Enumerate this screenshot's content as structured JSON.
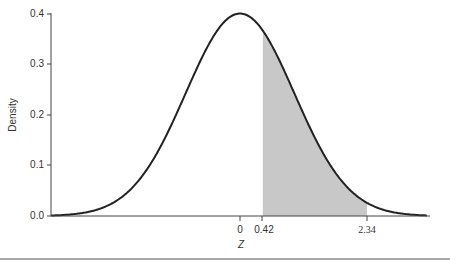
{
  "chart_data": {
    "type": "area",
    "title": "",
    "xlabel": "Z",
    "ylabel": "Density",
    "distribution": "standard normal",
    "ylim": [
      0.0,
      0.4
    ],
    "xlim": [
      -3.5,
      3.5
    ],
    "y_ticks": [
      "0.0",
      "0.1",
      "0.2",
      "0.3",
      "0.4"
    ],
    "x_ticks": [
      "0",
      "0.42",
      "2.34"
    ],
    "shaded_region": {
      "from": 0.42,
      "to": 2.34,
      "color": "#c8c8c8"
    },
    "grid": false,
    "legend": null,
    "series": [
      {
        "name": "Normal density",
        "x": [
          -3.5,
          -3,
          -2.5,
          -2,
          -1.5,
          -1,
          -0.5,
          0,
          0.5,
          1,
          1.5,
          2,
          2.5,
          3,
          3.5
        ],
        "values": [
          0.0009,
          0.0044,
          0.0175,
          0.054,
          0.1295,
          0.242,
          0.3521,
          0.3989,
          0.3521,
          0.242,
          0.1295,
          0.054,
          0.0175,
          0.0044,
          0.0009
        ]
      }
    ]
  },
  "axis": {
    "y_label": "Density",
    "x_label": "Z",
    "y_ticks": [
      "0.0",
      "0.1",
      "0.2",
      "0.3",
      "0.4"
    ],
    "x_ticks": [
      "0",
      "0.42",
      "2.34"
    ]
  },
  "colors": {
    "curve": "#222222",
    "shade": "#c8c8c8",
    "axis": "#444444"
  }
}
